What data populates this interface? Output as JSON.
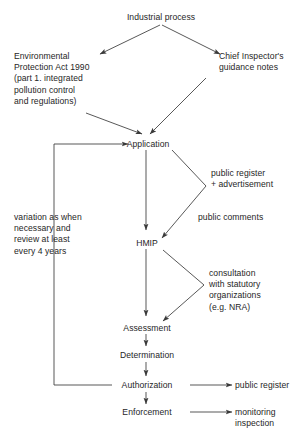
{
  "diagram": {
    "title": "Industrial process",
    "type": "flowchart",
    "orientation": "top-to-bottom",
    "background_color": "#ffffff",
    "line_color": "#3a3a3a",
    "text_color": "#262626"
  },
  "nodes": {
    "industrial_process": "Industrial process",
    "epa": "Environmental\nProtection Act 1990\n(part 1. integrated\npollution control\nand regulations)",
    "chief_inspector": "Chief Inspector's\nguidance notes",
    "application": "Application",
    "hmip": "HMIP",
    "assessment": "Assessment",
    "determination": "Determination",
    "authorization": "Authorization",
    "enforcement": "Enforcement"
  },
  "annotations": {
    "public_register_advert": "public register\n+ advertisement",
    "public_comments": "public comments",
    "consultation": "consultation\nwith statutory\norganizations\n(e.g. NRA)",
    "variation": "variation as when\nnecessary and\nreview at least\nevery 4 years"
  },
  "outputs": {
    "public_register": "public register",
    "monitoring_inspection": "monitoring\ninspection"
  }
}
